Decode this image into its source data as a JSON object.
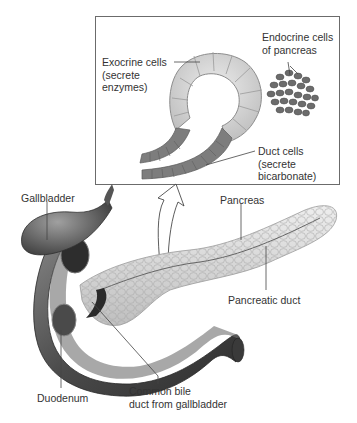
{
  "figure": {
    "inset": {
      "labels": {
        "exocrine": [
          "Exocrine cells",
          "(secrete",
          "enzymes)"
        ],
        "endocrine": [
          "Endocrine cells",
          "of pancreas"
        ],
        "duct": [
          "Duct cells",
          "(secrete",
          "bicarbonate)"
        ]
      }
    },
    "organ_labels": {
      "gallbladder": "Gallbladder",
      "pancreas": "Pancreas",
      "pancreatic_duct": "Pancreatic duct",
      "duodenum": "Duodenum",
      "common_bile_duct": [
        "Common bile",
        "duct from gallbladder"
      ]
    }
  },
  "colors": {
    "background": "#ffffff",
    "inset_border": "#6b6b6b",
    "exocrine_cell": "#d4d4d4",
    "duct_cell": "#7a7a7a",
    "endocrine_cell": "#6a6a6a",
    "pancreas_tissue": "#e2e2e2",
    "duodenum": "#5a5a5a",
    "leader_line": "#444444"
  }
}
